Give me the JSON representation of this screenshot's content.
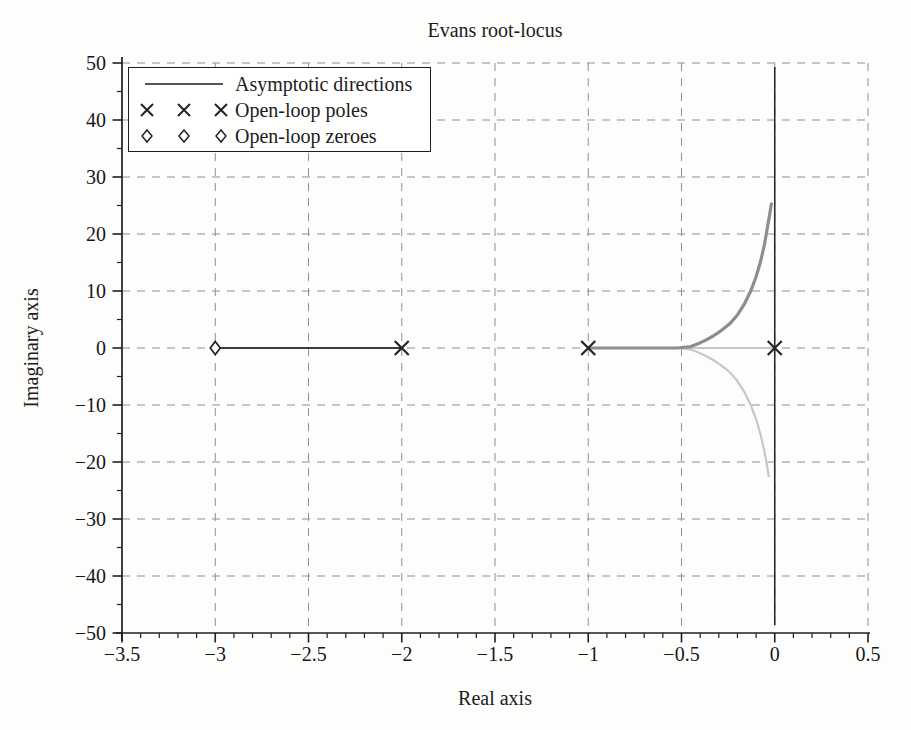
{
  "chart_data": {
    "type": "line",
    "title": "Evans root-locus",
    "xlabel": "Real axis",
    "ylabel": "Imaginary axis",
    "xlim": [
      -3.5,
      0.5
    ],
    "ylim": [
      -50,
      50
    ],
    "xticks": {
      "values": [
        -3.5,
        -3,
        -2.5,
        -2,
        -1.5,
        -1,
        -0.5,
        0,
        0.5
      ],
      "labels": [
        "−3.5",
        "−3",
        "−2.5",
        "−2",
        "−1.5",
        "−1",
        "−0.5",
        "0",
        "0.5"
      ],
      "minor_step": 0.1
    },
    "yticks": {
      "values": [
        50,
        40,
        30,
        20,
        10,
        0,
        -10,
        -20,
        -30,
        -40,
        -50
      ],
      "labels": [
        "50",
        "40",
        "30",
        "20",
        "10",
        "0",
        "−10",
        "−20",
        "−30",
        "−40",
        "−50"
      ],
      "minor_step": 5
    },
    "grid": {
      "style": "dashed",
      "color": "#8f8f8f",
      "on_major_ticks_only": true
    },
    "axis_color": "#1f1f1f",
    "marker_color": "#242424",
    "legend": [
      {
        "symbol": "line",
        "label": "Asymptotic directions"
      },
      {
        "symbol": "cross",
        "label": "Open-loop poles"
      },
      {
        "symbol": "diamond",
        "label": "Open-loop zeroes"
      }
    ],
    "open_loop_poles": [
      [
        0,
        0
      ],
      [
        -1,
        0
      ],
      [
        -2,
        0
      ]
    ],
    "open_loop_zeroes": [
      [
        -3,
        0
      ]
    ],
    "asymptotes": [
      {
        "x": 0,
        "y_min": -48.6,
        "y_max": 49.3,
        "color": "#2b2b2b",
        "width": 1.6
      }
    ],
    "branches": [
      {
        "name": "real-axis branch pole(-2) to zero(-3)",
        "color": "#3c3c3c",
        "width": 2,
        "points": [
          [
            -2,
            0
          ],
          [
            -3,
            0
          ]
        ]
      },
      {
        "name": "upper branch from pole(-1) toward asymptote",
        "color": "#8d8d8d",
        "width": 3.2,
        "points": [
          [
            -1,
            0
          ],
          [
            -0.52,
            0
          ],
          [
            -0.45,
            0.25
          ],
          [
            -0.415,
            0.7
          ],
          [
            -0.375,
            1.3
          ],
          [
            -0.33,
            2.1
          ],
          [
            -0.285,
            3.1
          ],
          [
            -0.24,
            4.3
          ],
          [
            -0.2,
            5.8
          ],
          [
            -0.165,
            7.6
          ],
          [
            -0.13,
            9.9
          ],
          [
            -0.1,
            12.5
          ],
          [
            -0.075,
            15.3
          ],
          [
            -0.055,
            18.2
          ],
          [
            -0.04,
            21
          ],
          [
            -0.028,
            23.3
          ],
          [
            -0.018,
            25.3
          ]
        ]
      },
      {
        "name": "lower branch from pole(0) toward asymptote",
        "color": "#c7c7c7",
        "width": 2.2,
        "points": [
          [
            0,
            0
          ],
          [
            -0.52,
            0
          ],
          [
            -0.45,
            -0.25
          ],
          [
            -0.415,
            -0.7
          ],
          [
            -0.375,
            -1.3
          ],
          [
            -0.33,
            -2.1
          ],
          [
            -0.285,
            -3.1
          ],
          [
            -0.24,
            -4.3
          ],
          [
            -0.2,
            -5.8
          ],
          [
            -0.165,
            -7.6
          ],
          [
            -0.13,
            -9.9
          ],
          [
            -0.1,
            -12.5
          ],
          [
            -0.075,
            -15.3
          ],
          [
            -0.055,
            -18.2
          ],
          [
            -0.042,
            -20.5
          ],
          [
            -0.032,
            -22.5
          ]
        ]
      }
    ],
    "breakaway_point": [
      -0.44,
      0
    ]
  }
}
